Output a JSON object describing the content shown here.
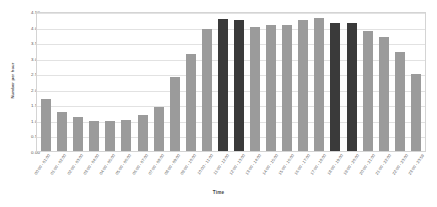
{
  "chart_data": {
    "type": "bar",
    "title": "",
    "xlabel": "Time",
    "ylabel": "Number per hour",
    "ylim": [
      0,
      4.5
    ],
    "ytick_step": 0.5,
    "grid": true,
    "legend": "none",
    "bar_color": "#9b9b9b",
    "highlight_color": "#3a3a3a",
    "highlight_indices": [
      11,
      12,
      18,
      19
    ],
    "yticks": [
      "0.00",
      "0.50",
      "1.00",
      "1.50",
      "2.00",
      "2.50",
      "3.00",
      "3.50",
      "4.00",
      "4.50"
    ],
    "categories": [
      "00:00 - 01:00",
      "01:00 - 02:00",
      "02:00 - 03:00",
      "03:00 - 04:00",
      "04:00 - 05:00",
      "05:00 - 06:00",
      "06:00 - 07:00",
      "07:00 - 08:00",
      "08:00 - 09:00",
      "09:00 - 10:00",
      "10:00 - 11:00",
      "11:00 - 12:00",
      "12:00 - 13:00",
      "13:00 - 14:00",
      "14:00 - 15:00",
      "15:00 - 16:00",
      "16:00 - 17:00",
      "17:00 - 18:00",
      "18:00 - 19:00",
      "19:00 - 20:00",
      "20:00 - 21:00",
      "21:00 - 22:00",
      "22:00 - 23:00",
      "23:00 - 23:59"
    ],
    "values": [
      1.68,
      1.24,
      1.1,
      0.98,
      0.98,
      1.0,
      1.15,
      1.4,
      2.38,
      3.13,
      3.92,
      4.25,
      4.22,
      3.98,
      4.05,
      4.05,
      4.22,
      4.28,
      4.12,
      4.12,
      3.85,
      3.68,
      3.18,
      2.48
    ]
  }
}
